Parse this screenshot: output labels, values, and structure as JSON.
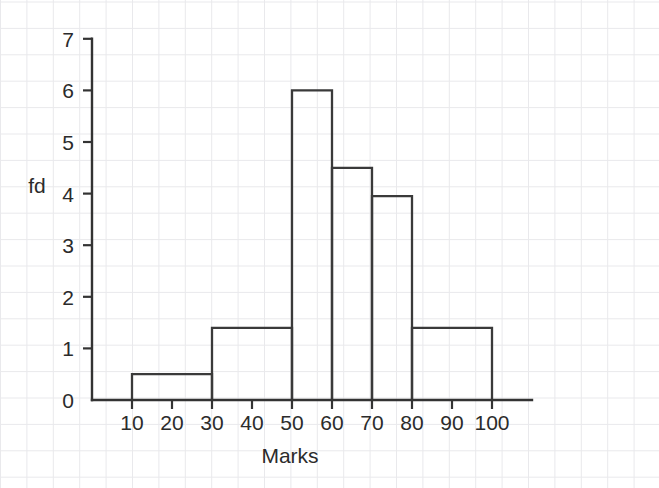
{
  "chart_data": {
    "type": "bar",
    "title": "",
    "subtitle": "",
    "xlabel": "Marks",
    "ylabel": "fd",
    "xlim": [
      0,
      110
    ],
    "ylim": [
      0,
      7
    ],
    "grid": true,
    "legend": null,
    "xticks": [
      "10",
      "20",
      "30",
      "40",
      "50",
      "60",
      "70",
      "80",
      "90",
      "100"
    ],
    "xtick_values": [
      10,
      20,
      30,
      40,
      50,
      60,
      70,
      80,
      90,
      100
    ],
    "yticks": [
      "0",
      "1",
      "2",
      "3",
      "4",
      "5",
      "6",
      "7"
    ],
    "ytick_values": [
      0,
      1,
      2,
      3,
      4,
      5,
      6,
      7
    ],
    "bin_edges": [
      10,
      30,
      50,
      60,
      70,
      80,
      100
    ],
    "values": [
      0.5,
      1.4,
      6.0,
      4.5,
      3.95,
      1.4
    ],
    "bars": [
      {
        "label": "10-30",
        "start": 10,
        "end": 30,
        "value": 0.5
      },
      {
        "label": "30-50",
        "start": 30,
        "end": 50,
        "value": 1.4
      },
      {
        "label": "50-60",
        "start": 50,
        "end": 60,
        "value": 6.0
      },
      {
        "label": "60-70",
        "start": 60,
        "end": 70,
        "value": 4.5
      },
      {
        "label": "70-80",
        "start": 70,
        "end": 80,
        "value": 3.95
      },
      {
        "label": "80-100",
        "start": 80,
        "end": 100,
        "value": 1.4
      }
    ],
    "colors": {
      "bar_outline": "#3a3a3a",
      "bar_fill": "none",
      "axis": "#333333",
      "text": "#2b2b2b",
      "grid_minor": "#e9e9ec",
      "grid_major": "#dedee3",
      "background": "#ffffff"
    }
  }
}
